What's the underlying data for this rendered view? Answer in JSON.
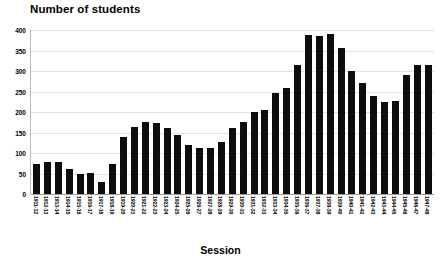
{
  "chart_data": {
    "type": "bar",
    "title": "Number of students",
    "xlabel": "Session",
    "ylabel": "",
    "ylim": [
      0,
      400
    ],
    "yticks": [
      0,
      50,
      100,
      150,
      200,
      250,
      300,
      350,
      400
    ],
    "ytick_labels": [
      "0",
      "50",
      "100",
      "150",
      "200",
      "250",
      "300",
      "350",
      "400"
    ],
    "grid": true,
    "legend": "none",
    "bar_color": "#0d0d0d",
    "categories": [
      "1911-12",
      "1912-13",
      "1913-14",
      "1914-15",
      "1915-16",
      "1916-17",
      "1917-18",
      "1918-19",
      "1919-20",
      "1920-21",
      "1921-22",
      "1922-23",
      "1923-24",
      "1924-25",
      "1925-26",
      "1926-27",
      "1927-28",
      "1928-29",
      "1929-30",
      "1930-31",
      "1931-32",
      "1932-33",
      "1933-34",
      "1934-35",
      "1935-36",
      "1936-37",
      "1937-38",
      "1938-39",
      "1939-40",
      "1940-41",
      "1941-42",
      "1942-43",
      "1943-44",
      "1944-45",
      "1945-46",
      "1946-47",
      "1947-48"
    ],
    "values": [
      73,
      77,
      77,
      61,
      50,
      51,
      30,
      73,
      140,
      163,
      175,
      172,
      160,
      145,
      120,
      112,
      113,
      128,
      160,
      175,
      200,
      205,
      247,
      258,
      315,
      388,
      385,
      390,
      355,
      300,
      270,
      240,
      225,
      226,
      290,
      315,
      315
    ]
  }
}
